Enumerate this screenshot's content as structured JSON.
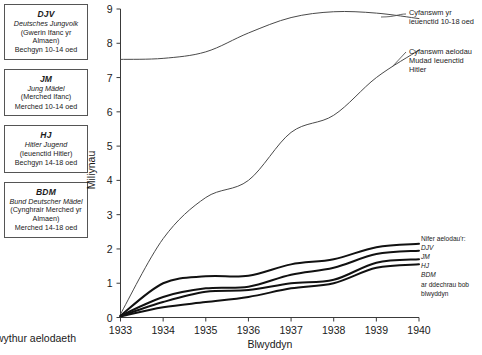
{
  "legend_boxes": [
    {
      "abbr": "DJV",
      "german": "Deutsches Jungvolk",
      "welsh": "(Gwerin Ifanc yr Almaen)",
      "age": "Bechgyn 10-14 oed"
    },
    {
      "abbr": "JM",
      "german": "Jung Mädel",
      "welsh": "(Merched Ifanc)",
      "age": "Merched 10-14 oed"
    },
    {
      "abbr": "HJ",
      "german": "Hitler Jugend",
      "welsh": "(Ieuenctid Hitler)",
      "age": "Bechgyn 14-18 oed"
    },
    {
      "abbr": "BDM",
      "german": "Bund Deutscher Mädel",
      "welsh": "(Cynghrair Merched yr Almaen)",
      "age": "Merched 14-18 oed"
    }
  ],
  "bottom_caption": "wythur aelodaeth",
  "annotations": {
    "total_youth": [
      "Cyfanswm yr",
      "ieuenctid 10-18 oed"
    ],
    "total_hj": [
      "Cyfanswm aelodau",
      "Mudad Ieuenctid",
      "Hitler"
    ],
    "members_header": "Nifer aelodau'r:",
    "members_series": [
      "DJV",
      "JM",
      "HJ",
      "BDM"
    ],
    "members_footer": [
      "ar ddechrau bob",
      "blwyddyn"
    ]
  },
  "chart_data": {
    "type": "line",
    "title": "",
    "xlabel": "Blwyddyn",
    "ylabel": "Miliynau",
    "x": [
      1933,
      1934,
      1935,
      1936,
      1937,
      1938,
      1939,
      1940
    ],
    "xlim": [
      1933,
      1940
    ],
    "ylim": [
      0,
      9
    ],
    "yticks": [
      0,
      1,
      2,
      3,
      4,
      5,
      6,
      7,
      8,
      9
    ],
    "xticks": [
      "1933",
      "1934",
      "1935",
      "1936",
      "1937",
      "1938",
      "1939",
      "1940"
    ],
    "grid": false,
    "legend": "annotations at right",
    "series": [
      {
        "name": "Cyfanswm yr ieuenctid 10-18 oed",
        "style": "thin",
        "values": [
          7.53,
          7.56,
          7.75,
          8.3,
          8.75,
          8.92,
          8.88,
          8.72
        ]
      },
      {
        "name": "Cyfanswm aelodau Mudad Ieuenctid Hitler",
        "style": "thin",
        "values": [
          0.1,
          2.3,
          3.5,
          4.0,
          5.4,
          5.9,
          7.0,
          7.8
        ]
      },
      {
        "name": "DJV",
        "style": "thick",
        "values": [
          0.05,
          1.0,
          1.2,
          1.22,
          1.55,
          1.7,
          2.05,
          2.15
        ]
      },
      {
        "name": "JM",
        "style": "thick",
        "values": [
          0.05,
          0.6,
          0.85,
          0.9,
          1.25,
          1.45,
          1.85,
          1.95
        ]
      },
      {
        "name": "HJ",
        "style": "thick",
        "values": [
          0.04,
          0.45,
          0.75,
          0.8,
          1.0,
          1.1,
          1.6,
          1.7
        ]
      },
      {
        "name": "BDM",
        "style": "thick",
        "values": [
          0.03,
          0.3,
          0.45,
          0.6,
          0.85,
          1.0,
          1.45,
          1.55
        ]
      }
    ]
  }
}
